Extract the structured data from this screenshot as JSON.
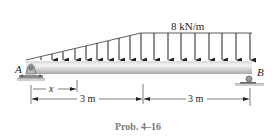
{
  "figure": {
    "caption": "Prob. 4–16",
    "load_label": "8 kN/m",
    "support_a_label": "A",
    "support_b_label": "B",
    "dim_x_label": "x",
    "dim_left_label": "3 m",
    "dim_right_label": "3 m",
    "colors": {
      "beam_top": "#f2f2f2",
      "beam_bottom": "#a8a8a8",
      "line": "#222222",
      "caption": "#7a7a7a",
      "support": "#9a9a9a"
    }
  },
  "load": {
    "type": "triangular then uniform",
    "max_intensity": "8 kN/m",
    "triangular_arrows_x": [
      52,
      63,
      75,
      86,
      97,
      108,
      119,
      130,
      141
    ],
    "uniform_arrows_x": [
      154,
      168,
      181,
      195,
      209,
      222,
      236,
      250
    ]
  }
}
